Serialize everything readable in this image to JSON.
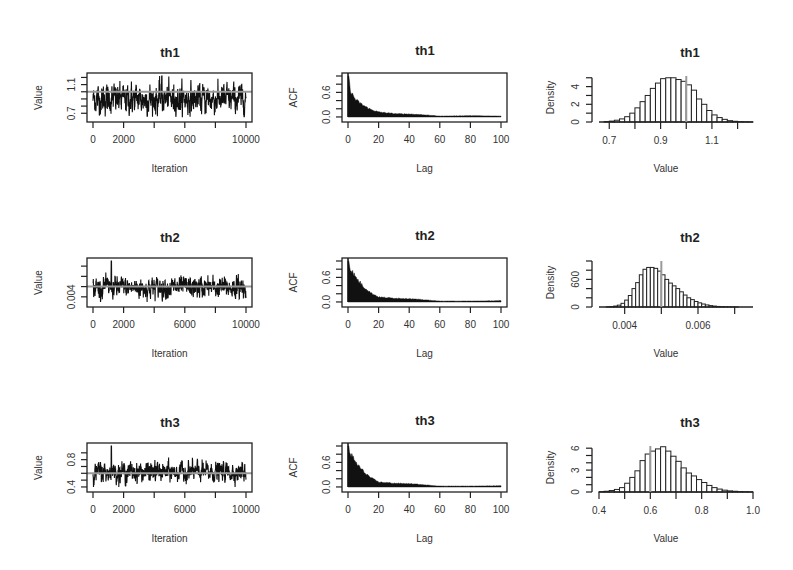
{
  "figure": {
    "rows": [
      "th1",
      "th2",
      "th3"
    ],
    "columns": [
      "trace",
      "acf",
      "histogram"
    ]
  },
  "chart_data": [
    {
      "type": "line",
      "panel": "trace",
      "param": "th1",
      "title": "th1",
      "xlabel": "Iteration",
      "ylabel": "Value",
      "xlim": [
        0,
        10000
      ],
      "xticks": [
        0,
        2000,
        6000,
        10000
      ],
      "xtick_minor": [
        0,
        2000,
        4000,
        6000,
        8000,
        10000
      ],
      "ylim": [
        0.62,
        1.22
      ],
      "yticks_labeled": [
        0.7,
        1.1
      ],
      "yticks": [
        0.7,
        0.8,
        0.9,
        1.0,
        1.1,
        1.2
      ],
      "center": 0.9,
      "spread": 0.1,
      "peak_iteration": 4500,
      "peak_value": 1.22,
      "true_value": 1.0,
      "ref_color": "#9a9a9a"
    },
    {
      "type": "bar",
      "panel": "acf",
      "param": "th1",
      "title": "th1",
      "xlabel": "Lag",
      "ylabel": "ACF",
      "xlim": [
        0,
        100
      ],
      "xticks": [
        0,
        20,
        40,
        60,
        80,
        100
      ],
      "ylim": [
        -0.05,
        1.0
      ],
      "yticks_labeled": [
        0.0,
        0.6
      ],
      "yticks": [
        0.0,
        0.2,
        0.4,
        0.6,
        0.8,
        1.0
      ],
      "lag": [
        0,
        2,
        5,
        10,
        15,
        20,
        30,
        40,
        50,
        60,
        80,
        100
      ],
      "acf": [
        1.0,
        0.6,
        0.42,
        0.28,
        0.18,
        0.12,
        0.08,
        0.07,
        0.05,
        0.02,
        0.03,
        0.02
      ]
    },
    {
      "type": "bar",
      "panel": "histogram",
      "param": "th1",
      "title": "th1",
      "xlabel": "Value",
      "ylabel": "Density",
      "xlim": [
        0.66,
        1.26
      ],
      "xticks": [
        0.7,
        0.8,
        0.9,
        1.0,
        1.1,
        1.2
      ],
      "xtick_labels": [
        "0.7",
        "",
        "0.9",
        "",
        "1.1",
        ""
      ],
      "ylim": [
        0,
        5.2
      ],
      "yticks_labeled": [
        0,
        2,
        4
      ],
      "yticks": [
        0,
        1,
        2,
        3,
        4,
        5
      ],
      "bin_width": 0.02,
      "bin_start": 0.68,
      "density": [
        0.05,
        0.1,
        0.2,
        0.35,
        0.6,
        1.0,
        1.6,
        2.3,
        3.0,
        3.8,
        4.4,
        4.9,
        5.0,
        5.0,
        4.8,
        4.6,
        4.2,
        3.6,
        2.6,
        2.0,
        1.3,
        0.8,
        0.5,
        0.3,
        0.15,
        0.08,
        0.04,
        0.02,
        0.01,
        0.0
      ],
      "true_value": 1.0,
      "ref_color": "#9a9a9a"
    },
    {
      "type": "line",
      "panel": "trace",
      "param": "th2",
      "title": "th2",
      "xlabel": "Iteration",
      "ylabel": "Value",
      "xlim": [
        0,
        10000
      ],
      "xticks": [
        0,
        2000,
        6000,
        10000
      ],
      "xtick_minor": [
        0,
        2000,
        4000,
        6000,
        8000,
        10000
      ],
      "ylim": [
        0.0033,
        0.0075
      ],
      "yticks_labeled": [
        0.004
      ],
      "yticks": [
        0.004,
        0.005,
        0.006,
        0.007
      ],
      "center": 0.0049,
      "spread": 0.0005,
      "peak_iteration": 1200,
      "peak_value": 0.0075,
      "true_value": 0.005,
      "ref_color": "#9a9a9a"
    },
    {
      "type": "bar",
      "panel": "acf",
      "param": "th2",
      "title": "th2",
      "xlabel": "Lag",
      "ylabel": "ACF",
      "xlim": [
        0,
        100
      ],
      "xticks": [
        0,
        20,
        40,
        60,
        80,
        100
      ],
      "ylim": [
        -0.05,
        1.0
      ],
      "yticks_labeled": [
        0.0,
        0.6
      ],
      "yticks": [
        0.0,
        0.2,
        0.4,
        0.6,
        0.8,
        1.0
      ],
      "lag": [
        0,
        2,
        5,
        10,
        15,
        20,
        30,
        40,
        50,
        60,
        80,
        100
      ],
      "acf": [
        1.0,
        0.78,
        0.6,
        0.38,
        0.22,
        0.12,
        0.09,
        0.08,
        0.05,
        0.02,
        0.02,
        0.03
      ]
    },
    {
      "type": "bar",
      "panel": "histogram",
      "param": "th2",
      "title": "th2",
      "xlabel": "Value",
      "ylabel": "Density",
      "xlim": [
        0.0033,
        0.0075
      ],
      "xticks": [
        0.004,
        0.005,
        0.006,
        0.007
      ],
      "xtick_labels": [
        "0.004",
        "",
        "0.006",
        ""
      ],
      "ylim": [
        0,
        1000
      ],
      "yticks_labeled": [
        0,
        600
      ],
      "yticks": [
        0,
        200,
        400,
        600,
        800,
        1000
      ],
      "bin_width": 0.0001,
      "bin_start": 0.0035,
      "density": [
        5,
        10,
        20,
        40,
        80,
        150,
        250,
        400,
        530,
        700,
        820,
        860,
        860,
        840,
        780,
        700,
        600,
        520,
        460,
        400,
        330,
        260,
        200,
        160,
        120,
        90,
        65,
        45,
        30,
        20,
        12,
        8,
        5,
        3,
        2,
        1
      ],
      "true_value": 0.005,
      "ref_color": "#9a9a9a"
    },
    {
      "type": "line",
      "panel": "trace",
      "param": "th3",
      "title": "th3",
      "xlabel": "Iteration",
      "ylabel": "Value",
      "xlim": [
        0,
        10000
      ],
      "xticks": [
        0,
        2000,
        6000,
        10000
      ],
      "xtick_minor": [
        0,
        2000,
        4000,
        6000,
        8000,
        10000
      ],
      "ylim": [
        0.37,
        1.0
      ],
      "yticks_labeled": [
        0.4,
        0.8
      ],
      "yticks": [
        0.4,
        0.5,
        0.6,
        0.7,
        0.8,
        0.9
      ],
      "center": 0.62,
      "spread": 0.07,
      "peak_iteration": 1200,
      "peak_value": 1.0,
      "true_value": 0.6,
      "ref_color": "#9a9a9a"
    },
    {
      "type": "bar",
      "panel": "acf",
      "param": "th3",
      "title": "th3",
      "xlabel": "Lag",
      "ylabel": "ACF",
      "xlim": [
        0,
        100
      ],
      "xticks": [
        0,
        20,
        40,
        60,
        80,
        100
      ],
      "ylim": [
        -0.05,
        1.0
      ],
      "yticks_labeled": [
        0.0,
        0.6
      ],
      "yticks": [
        0.0,
        0.2,
        0.4,
        0.6,
        0.8,
        1.0
      ],
      "lag": [
        0,
        2,
        5,
        10,
        15,
        20,
        30,
        40,
        50,
        60,
        80,
        100
      ],
      "acf": [
        1.0,
        0.78,
        0.6,
        0.38,
        0.22,
        0.12,
        0.09,
        0.08,
        0.05,
        0.02,
        0.02,
        0.03
      ]
    },
    {
      "type": "bar",
      "panel": "histogram",
      "param": "th3",
      "title": "th3",
      "xlabel": "Value",
      "ylabel": "Density",
      "xlim": [
        0.4,
        1.0
      ],
      "xticks": [
        0.4,
        0.5,
        0.6,
        0.7,
        0.8,
        0.9,
        1.0
      ],
      "xtick_labels": [
        "0.4",
        "",
        "0.6",
        "",
        "0.8",
        "",
        "1.0"
      ],
      "ylim": [
        0,
        6.3
      ],
      "yticks_labeled": [
        0,
        3,
        6
      ],
      "yticks": [
        0,
        1,
        2,
        3,
        4,
        5,
        6
      ],
      "bin_width": 0.02,
      "bin_start": 0.4,
      "density": [
        0.05,
        0.1,
        0.2,
        0.35,
        0.6,
        1.2,
        2.0,
        2.9,
        4.3,
        5.2,
        5.6,
        5.9,
        6.2,
        5.6,
        4.9,
        4.2,
        3.3,
        2.6,
        2.2,
        1.7,
        1.3,
        0.9,
        0.6,
        0.4,
        0.25,
        0.15,
        0.1,
        0.06,
        0.04,
        0.02
      ],
      "true_value": 0.6,
      "ref_color": "#9a9a9a"
    }
  ]
}
